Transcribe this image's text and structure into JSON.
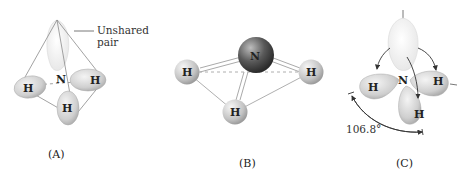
{
  "panels": [
    {
      "id": "A",
      "caption": "(A)",
      "central_atom": "N",
      "hydrogens": [
        "H",
        "H",
        "H"
      ],
      "annotation": {
        "line1": "Unshared",
        "line2": "pair"
      }
    },
    {
      "id": "B",
      "caption": "(B)",
      "central_atom": "N",
      "hydrogens": [
        "H",
        "H",
        "H"
      ]
    },
    {
      "id": "C",
      "caption": "(C)",
      "central_atom": "N",
      "hydrogens": [
        "H",
        "H",
        "H"
      ],
      "bond_angle": "106.8°"
    }
  ],
  "colors": {
    "orbital_fill": "#d9d9d9",
    "lone_pair_fill": "#efefef",
    "nitrogen_fill": "#555555",
    "hydrogen_fill": "#cfcfcf",
    "line": "#888888"
  }
}
